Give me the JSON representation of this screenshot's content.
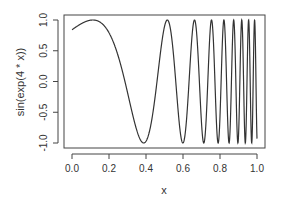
{
  "chart_data": {
    "type": "line",
    "title": "",
    "xlabel": "x",
    "ylabel": "sin(exp(4 * x))",
    "function": "sin(exp(4 * x))",
    "xlim": [
      0,
      1
    ],
    "ylim": [
      -1,
      1
    ],
    "x_ticks": [
      "0.0",
      "0.2",
      "0.4",
      "0.6",
      "0.8",
      "1.0"
    ],
    "y_ticks": [
      "-1.0",
      "-0.5",
      "0.0",
      "0.5",
      "1.0"
    ],
    "grid": false,
    "legend": null,
    "series": [
      {
        "name": "sin(exp(4 * x))",
        "color": "#333333",
        "x": [
          0.0,
          0.1,
          0.2,
          0.3,
          0.4,
          0.5,
          0.6,
          0.7,
          0.8,
          0.9,
          1.0
        ],
        "values": [
          0.841,
          0.986,
          0.624,
          -0.594,
          -0.999,
          0.893,
          -0.315,
          -0.999,
          0.231,
          0.557,
          -0.959
        ]
      }
    ]
  }
}
